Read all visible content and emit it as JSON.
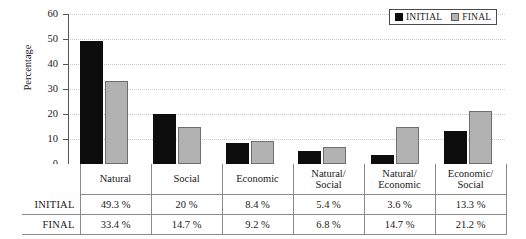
{
  "chart_data": {
    "type": "bar",
    "title": "",
    "xlabel": "",
    "ylabel": "Percentage",
    "ylim": [
      0,
      60
    ],
    "yticks": [
      0,
      10,
      20,
      30,
      40,
      50,
      60
    ],
    "grid": true,
    "legend_position": "top-right",
    "categories": [
      "Natural",
      "Social",
      "Economic",
      "Natural/\nSocial",
      "Natural/\nEconomic",
      "Economic/\nSocial"
    ],
    "series": [
      {
        "name": "INITIAL",
        "color": "#0d0d0d",
        "values": [
          49.3,
          20,
          8.4,
          5.4,
          3.6,
          13.3
        ]
      },
      {
        "name": "FINAL",
        "color": "#b2b2b2",
        "values": [
          33.4,
          14.7,
          9.2,
          6.8,
          14.7,
          21.2
        ]
      }
    ]
  },
  "axis": {
    "y_title": "Percentage",
    "y_tick_labels": [
      "0",
      "10",
      "20",
      "30",
      "40",
      "50",
      "60"
    ]
  },
  "legend": {
    "entries": [
      {
        "label": "INITIAL",
        "swatch": "filled-black-square"
      },
      {
        "label": "FINAL",
        "swatch": "filled-gray-square"
      }
    ]
  },
  "table": {
    "category_labels": [
      {
        "line1": "Natural",
        "line2": ""
      },
      {
        "line1": "Social",
        "line2": ""
      },
      {
        "line1": "Economic",
        "line2": ""
      },
      {
        "line1": "Natural/",
        "line2": "Social"
      },
      {
        "line1": "Natural/",
        "line2": "Economic"
      },
      {
        "line1": "Economic/",
        "line2": "Social"
      }
    ],
    "rows": [
      {
        "label": "INITIAL",
        "values": [
          "49.3 %",
          "20 %",
          "8.4 %",
          "5.4 %",
          "3.6 %",
          "13.3 %"
        ]
      },
      {
        "label": "FINAL",
        "values": [
          "33.4 %",
          "14.7 %",
          "9.2 %",
          "6.8 %",
          "14.7 %",
          "21.2 %"
        ]
      }
    ]
  }
}
